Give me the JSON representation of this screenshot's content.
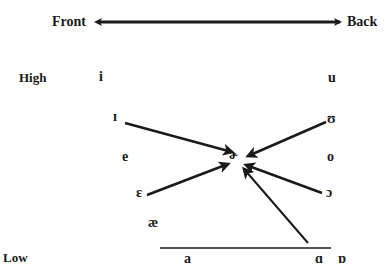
{
  "diagram": {
    "axis": {
      "front_label": "Front",
      "back_label": "Back",
      "high_label": "High",
      "low_label": "Low"
    },
    "vowels": {
      "i": "i",
      "u": "u",
      "near_close_front": "ɪ",
      "near_close_back": "ʊ",
      "e": "e",
      "o": "o",
      "center_rhotic": "ɚ",
      "open_mid_front": "ɛ",
      "open_mid_back": "ɔ",
      "ae": "æ",
      "a": "a",
      "open_back_unrounded": "ɑ",
      "open_back_rounded": "ɒ"
    },
    "arrows": [
      {
        "from": "ɪ",
        "to": "ɚ"
      },
      {
        "from": "ʊ",
        "to": "ɚ"
      },
      {
        "from": "ɛ",
        "to": "ɚ"
      },
      {
        "from": "ɔ",
        "to": "ɚ"
      },
      {
        "from": "ɑ",
        "to": "ɚ"
      }
    ],
    "color": "#1a1a1a"
  }
}
